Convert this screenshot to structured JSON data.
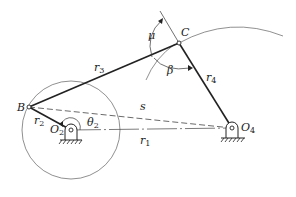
{
  "diagram": {
    "type": "four-bar linkage",
    "points": {
      "B": {
        "label": "B",
        "x": 29,
        "y": 107
      },
      "C": {
        "label": "C",
        "x": 179,
        "y": 43
      },
      "O2": {
        "label": "O",
        "sub": "2",
        "x": 71,
        "y": 130
      },
      "O4": {
        "label": "O",
        "sub": "4",
        "x": 232,
        "y": 128
      }
    },
    "links": {
      "r1": {
        "label": "r",
        "sub": "1"
      },
      "r2": {
        "label": "r",
        "sub": "2"
      },
      "r3": {
        "label": "r",
        "sub": "3"
      },
      "r4": {
        "label": "r",
        "sub": "4"
      },
      "s": {
        "label": "s"
      }
    },
    "angles": {
      "theta2": {
        "label": "θ",
        "sub": "2"
      },
      "mu": {
        "label": "μ"
      },
      "beta": {
        "label": "β"
      }
    },
    "colors": {
      "line": "#222222",
      "thin": "#555555",
      "background": "#ffffff"
    }
  }
}
